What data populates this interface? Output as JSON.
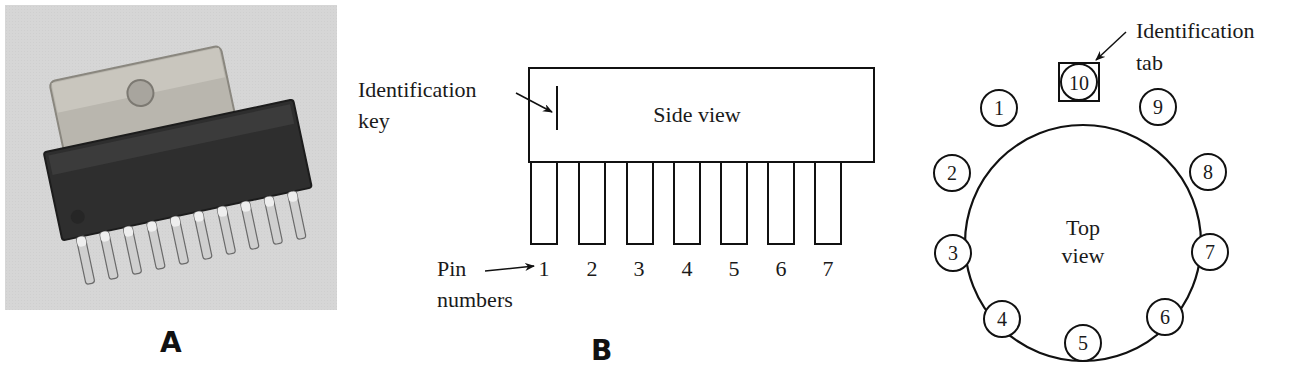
{
  "figure": {
    "panels": [
      {
        "id": "A",
        "label": "A",
        "content": "Photograph of a single in-line (SIP) integrated circuit package with metal heat-sink tab and 10 pins"
      },
      {
        "id": "B",
        "label": "B",
        "content": "Side view drawing of in-line package"
      },
      {
        "id": "C",
        "label": "",
        "content": "Top view drawing of circular (TO-style) package"
      }
    ]
  },
  "panel_a": {
    "letter": "A"
  },
  "panel_b": {
    "letter": "B",
    "box_label": "Side view",
    "key_label_line1": "Identification",
    "key_label_line2": "key",
    "pin_label_line1": "Pin",
    "pin_label_line2": "numbers",
    "pins": [
      "1",
      "2",
      "3",
      "4",
      "5",
      "6",
      "7"
    ]
  },
  "panel_c": {
    "center_label_line1": "Top",
    "center_label_line2": "view",
    "tab_label_line1": "Identification",
    "tab_label_line2": "tab",
    "tab_pin": "10",
    "pins": [
      "1",
      "2",
      "3",
      "4",
      "5",
      "6",
      "7",
      "8",
      "9"
    ]
  }
}
